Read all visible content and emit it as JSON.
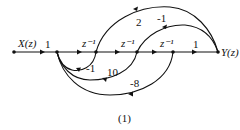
{
  "diagram": {
    "type": "signal-flow-graph",
    "caption": "(1)",
    "input_label": "X(z)",
    "output_label": "Y(z)",
    "forward_gains": {
      "input_branch": "1",
      "delay_1": "z⁻¹",
      "delay_2": "z⁻¹",
      "delay_3": "z⁻¹",
      "output_branch": "1"
    },
    "feedforward_gains": {
      "outer": "2",
      "inner": "-1"
    },
    "feedback_gains": {
      "inner": "-1",
      "middle": "10",
      "outer": "-8"
    }
  }
}
